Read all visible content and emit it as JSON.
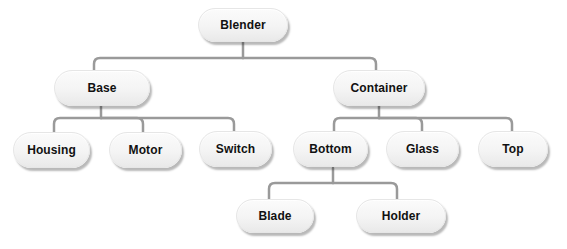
{
  "diagram": {
    "type": "tree",
    "root": "Blender",
    "nodes": {
      "blender": {
        "label": "Blender"
      },
      "base": {
        "label": "Base"
      },
      "container": {
        "label": "Container"
      },
      "housing": {
        "label": "Housing"
      },
      "motor": {
        "label": "Motor"
      },
      "switch": {
        "label": "Switch"
      },
      "bottom": {
        "label": "Bottom"
      },
      "glass": {
        "label": "Glass"
      },
      "top": {
        "label": "Top"
      },
      "blade": {
        "label": "Blade"
      },
      "holder": {
        "label": "Holder"
      }
    },
    "edges": [
      [
        "Blender",
        "Base"
      ],
      [
        "Blender",
        "Container"
      ],
      [
        "Base",
        "Housing"
      ],
      [
        "Base",
        "Motor"
      ],
      [
        "Base",
        "Switch"
      ],
      [
        "Container",
        "Bottom"
      ],
      [
        "Container",
        "Glass"
      ],
      [
        "Container",
        "Top"
      ],
      [
        "Bottom",
        "Blade"
      ],
      [
        "Bottom",
        "Holder"
      ]
    ],
    "colors": {
      "connector": "#9a9a9a",
      "node_fill": "#f4f4f4",
      "text": "#111111",
      "background": "#ffffff"
    }
  }
}
